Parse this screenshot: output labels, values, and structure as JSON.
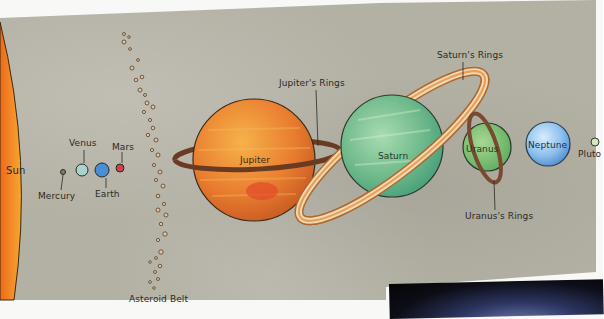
{
  "diagram": {
    "background_color": "#b3b0a4",
    "bodies": [
      {
        "name": "Sun",
        "label": "Sun",
        "color": "#f29a2a"
      },
      {
        "name": "Mercury",
        "label": "Mercury",
        "color": "#8a7a5a"
      },
      {
        "name": "Venus",
        "label": "Venus",
        "color": "#a9d3cf"
      },
      {
        "name": "Earth",
        "label": "Earth",
        "color": "#4a8ed6"
      },
      {
        "name": "Mars",
        "label": "Mars",
        "color": "#d0424a"
      },
      {
        "name": "Asteroid Belt",
        "label": "Asteroid Belt",
        "color": "#8a6a4a"
      },
      {
        "name": "Jupiter",
        "label": "Jupiter",
        "color": "#e8843a"
      },
      {
        "name": "Saturn",
        "label": "Saturn",
        "color": "#6fb88a"
      },
      {
        "name": "Uranus",
        "label": "Uranus",
        "color": "#7cc06a"
      },
      {
        "name": "Neptune",
        "label": "Neptune",
        "color": "#8cc0ec"
      },
      {
        "name": "Pluto",
        "label": "Pluto",
        "color": "#d8e6c0"
      }
    ],
    "ring_labels": {
      "jupiter": "Jupiter's Rings",
      "saturn": "Saturn's Rings",
      "uranus": "Uranus's Rings"
    }
  }
}
